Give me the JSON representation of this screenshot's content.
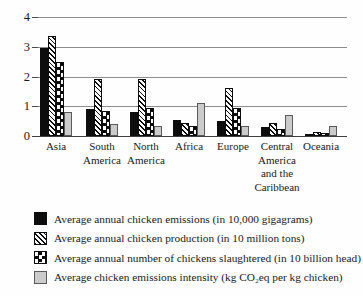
{
  "chart_data": {
    "type": "bar",
    "categories": [
      "Asia",
      "South America",
      "North America",
      "Africa",
      "Europe",
      "Central America and the Caribbean",
      "Oceania"
    ],
    "series": [
      {
        "name": "Average annual chicken emissions (in 10,000 gigagrams)",
        "pattern": "solid-black",
        "values": [
          2.95,
          0.9,
          0.8,
          0.55,
          0.5,
          0.3,
          0.05
        ]
      },
      {
        "name": "Average annual chicken production (in 10 million tons)",
        "pattern": "diagonal-hatch",
        "values": [
          3.35,
          1.9,
          1.9,
          0.45,
          1.6,
          0.45,
          0.15
        ]
      },
      {
        "name": "Average annual number of chickens slaughtered (in 10 billion head)",
        "pattern": "checkerboard",
        "values": [
          2.5,
          0.85,
          0.95,
          0.35,
          0.95,
          0.25,
          0.1
        ]
      },
      {
        "name": "Average chicken emissions intensity (kg CO₂eq per kg chicken)",
        "pattern": "solid-gray",
        "values": [
          0.8,
          0.4,
          0.35,
          1.1,
          0.35,
          0.7,
          0.35
        ]
      }
    ],
    "title": "",
    "xlabel": "",
    "ylabel": "",
    "ylim": [
      0,
      4
    ],
    "yticks": [
      0,
      1,
      2,
      3,
      4
    ],
    "grid": true,
    "legend_position": "bottom-left"
  },
  "colors": {
    "bar_black": "#0d0d0d",
    "bar_gray": "#cbcbcb",
    "grid_line": "#8e8e8e",
    "baseline": "#3f3f3f",
    "text": "#1a1a1a",
    "background": "#fefefe"
  }
}
